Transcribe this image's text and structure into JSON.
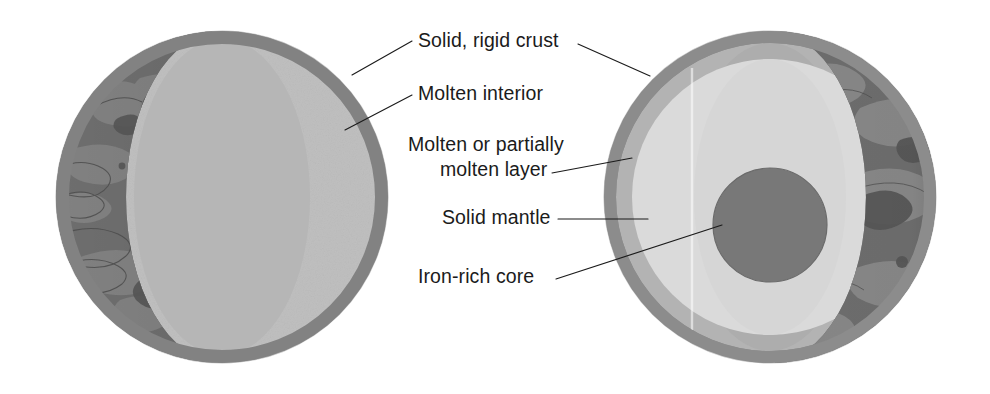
{
  "figure": {
    "kind": "planetary-interior-cutaway-diagram",
    "spheres": [
      {
        "id": "left-sphere",
        "name": "Planet with molten interior",
        "layers": [
          {
            "name": "Solid, rigid crust",
            "color": "#7f7f7f"
          },
          {
            "name": "Molten interior",
            "color": "#bdbdbd"
          },
          {
            "name": "Cratered surface",
            "color": "#6e6e6e"
          }
        ]
      },
      {
        "id": "right-sphere",
        "name": "Differentiated planet with iron-rich core",
        "layers": [
          {
            "name": "Solid, rigid crust",
            "color": "#8a8a8a"
          },
          {
            "name": "Molten or partially molten layer",
            "color": "#b2b2b2"
          },
          {
            "name": "Solid mantle",
            "color": "#d8d8d8"
          },
          {
            "name": "Iron-rich core",
            "color": "#767676"
          },
          {
            "name": "Cratered surface",
            "color": "#6e6e6e"
          }
        ]
      }
    ]
  },
  "labels": [
    {
      "id": "solid-rigid-crust",
      "text": "Solid, rigid crust",
      "x": 418,
      "y": 47
    },
    {
      "id": "molten-interior",
      "text": "Molten interior",
      "x": 418,
      "y": 100
    },
    {
      "id": "molten-or-partially-molten-layer",
      "line1": "Molten or partially",
      "line2": "molten layer",
      "x": 408,
      "y": 151,
      "y2": 176
    },
    {
      "id": "solid-mantle",
      "text": "Solid mantle",
      "x": 442,
      "y": 224
    },
    {
      "id": "iron-rich-core",
      "text": "Iron-rich core",
      "x": 418,
      "y": 283
    }
  ],
  "colors": {
    "background": "#ffffff",
    "ink": "#1b1b1b",
    "surface_dark": "#6e6e6e",
    "surface_patch_light": "#8b8b8b",
    "surface_patch_dark": "#585858",
    "crust_rim": "#7f7f7f",
    "molten_interior": "#bdbdbd",
    "molten_layer": "#b2b2b2",
    "solid_mantle": "#d8d8d8",
    "iron_core": "#767676"
  }
}
